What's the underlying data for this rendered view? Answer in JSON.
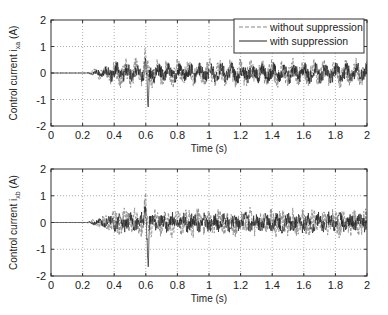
{
  "chart_data": [
    {
      "type": "line",
      "title": "",
      "xlabel": "Time (s)",
      "ylabel": "Control current i_xa (A)",
      "ylabel_main": "Control current i",
      "ylabel_sub": "xa",
      "ylabel_unit": "(A)",
      "xlim": [
        0,
        2
      ],
      "ylim": [
        -2,
        2
      ],
      "xticks": [
        "0",
        "0.2",
        "0.4",
        "0.6",
        "0.8",
        "1",
        "1.2",
        "1.4",
        "1.6",
        "1.8",
        "2"
      ],
      "yticks": [
        "2",
        "1",
        "0",
        "-1",
        "-2"
      ],
      "grid": true,
      "legend_position": "upper right",
      "series": [
        {
          "name": "without suppression",
          "style": "dashed",
          "color": "#888888",
          "description": "Zero until ~0.22 s, oscillation grows to ~±0.5 by 0.4 s, peaks ~+1.0 near 0.6 s, then ±0.6 random oscillation until 2 s"
        },
        {
          "name": "with suppression",
          "style": "solid",
          "color": "#222222",
          "description": "Zero until ~0.22 s, oscillation similar; sharp negative spike to ~-1.5 at ~0.61 s, then ±0.4 oscillation until 2 s"
        }
      ]
    },
    {
      "type": "line",
      "title": "",
      "xlabel": "Time (s)",
      "ylabel": "Control current i_xb (A)",
      "ylabel_main": "Control current i",
      "ylabel_sub": "xb",
      "ylabel_unit": "(A)",
      "xlim": [
        0,
        2
      ],
      "ylim": [
        -2,
        2
      ],
      "xticks": [
        "0",
        "0.2",
        "0.4",
        "0.6",
        "0.8",
        "1",
        "1.2",
        "1.4",
        "1.6",
        "1.8",
        "2"
      ],
      "yticks": [
        "2",
        "1",
        "0",
        "-1",
        "-2"
      ],
      "grid": true,
      "legend_position": "none",
      "series": [
        {
          "name": "without suppression",
          "style": "dashed",
          "color": "#888888",
          "description": "Zero until ~0.22 s, grows, peak ~+1.0 near 0.6 s, ±0.6 oscillation thereafter"
        },
        {
          "name": "with suppression",
          "style": "solid",
          "color": "#222222",
          "description": "Zero until ~0.22 s, negative spike ~-1.5 at ~0.61 s, ±0.4 oscillation thereafter"
        }
      ]
    }
  ],
  "legend": {
    "entries": [
      "without suppression",
      "with suppression"
    ]
  }
}
